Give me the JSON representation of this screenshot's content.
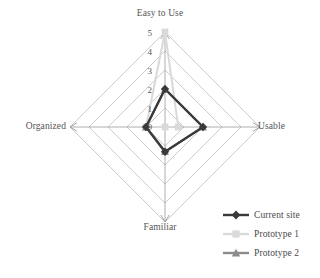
{
  "chart_data": {
    "type": "radar",
    "title": "",
    "categories": [
      "Easy to Use",
      "Usable",
      "Familiar",
      "Organized"
    ],
    "tick_labels": [
      "5",
      "4",
      "3",
      "2",
      "1",
      "0"
    ],
    "rlim": [
      0,
      5
    ],
    "rticks": [
      0,
      1,
      2,
      3,
      4,
      5
    ],
    "grid": true,
    "grid_shape": "polygon",
    "grid_color": "#bfbfbf",
    "legend_position": "bottom-right",
    "series": [
      {
        "name": "Current site",
        "color": "#3a3a3a",
        "marker": "diamond",
        "values": [
          2,
          2,
          1.3,
          1
        ]
      },
      {
        "name": "Prototype 1",
        "color": "#d9d9d9",
        "marker": "square",
        "values": [
          5,
          0.7,
          0,
          1
        ]
      },
      {
        "name": "Prototype 2",
        "color": "#8c8c8c",
        "marker": "triangle",
        "values": [
          2,
          2,
          1.3,
          1
        ]
      }
    ]
  },
  "axis_labels": {
    "top": "Easy to Use",
    "right": "Usable",
    "bottom": "Familiar",
    "left": "Organized"
  },
  "ticks": [
    {
      "value": "5",
      "y": 28
    },
    {
      "value": "4",
      "y": 47
    },
    {
      "value": "3",
      "y": 66
    },
    {
      "value": "2",
      "y": 85
    },
    {
      "value": "1",
      "y": 104
    },
    {
      "value": "0",
      "y": 122
    }
  ],
  "legend": {
    "items": [
      {
        "label": "Current site",
        "color": "#3a3a3a",
        "marker": "diamond"
      },
      {
        "label": "Prototype 1",
        "color": "#d9d9d9",
        "marker": "square"
      },
      {
        "label": "Prototype 2",
        "color": "#8c8c8c",
        "marker": "triangle"
      }
    ]
  }
}
